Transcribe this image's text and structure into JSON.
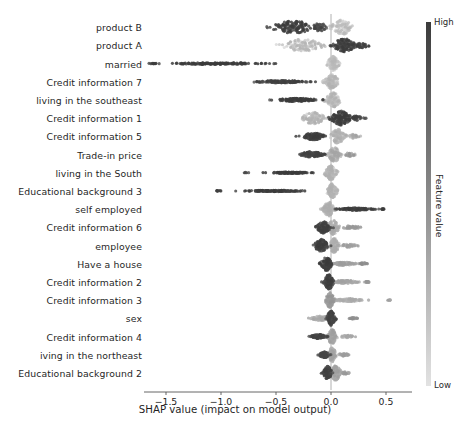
{
  "figure": {
    "width": 470,
    "height": 432,
    "background": "#ffffff"
  },
  "axes": {
    "plot_left": 148,
    "plot_right": 408,
    "plot_top": 18,
    "plot_bottom": 392,
    "zero_x_px": 331,
    "px_per_unit": 110
  },
  "colorbar": {
    "high_label": "High",
    "low_label": "Low",
    "title": "Feature value",
    "high_color": "#3b3b3b",
    "low_color": "#e2e2e2",
    "x": 426,
    "y_top": 22,
    "y_bottom": 386,
    "width": 5
  },
  "caption_ghost": "",
  "chart_data": {
    "type": "scatter",
    "subtype": "shap-beeswarm-summary",
    "title": "",
    "xlabel": "SHAP value (impact on model output)",
    "ylabel": "",
    "colorbar_label": "Feature value",
    "grid": false,
    "legend": "colorbar-right",
    "xlim": [
      -1.75,
      0.62
    ],
    "xticks": [
      -1.5,
      -1.0,
      -0.5,
      0.0,
      0.5
    ],
    "xticklabels": [
      "−1.5",
      "−1.0",
      "−0.5",
      "0.0",
      "0.5"
    ],
    "zero_line": 0.0,
    "color_scale": {
      "low": "#e2e2e2",
      "high": "#3b3b3b",
      "low_label": "Low",
      "high_label": "High"
    },
    "categories": [
      "product B",
      "product A",
      "married",
      "Credit information 7",
      "living in the southeast",
      "Credit information 1",
      "Credit information 5",
      "Trade-in price",
      "living in the South",
      "Educational background 3",
      "self employed",
      "Credit information 6",
      "employee",
      "Have a house",
      "Credit information 2",
      "Credit information 3",
      "sex",
      "Credit information 4",
      "iving in the northeast",
      "Educational background 2"
    ],
    "series": [
      {
        "name": "product B",
        "n": 260,
        "clusters": [
          {
            "center": -0.34,
            "spread": 0.175,
            "weight": 0.48,
            "value": 0.92,
            "thickness": 0.85
          },
          {
            "center": -0.1,
            "spread": 0.075,
            "weight": 0.17,
            "value": 0.8,
            "thickness": 0.55
          },
          {
            "center": 0.1,
            "spread": 0.085,
            "weight": 0.35,
            "value": 0.1,
            "thickness": 1.0
          }
        ],
        "range": [
          -0.62,
          0.3
        ]
      },
      {
        "name": "product A",
        "n": 260,
        "clusters": [
          {
            "center": -0.26,
            "spread": 0.155,
            "weight": 0.42,
            "value": 0.12,
            "thickness": 0.9
          },
          {
            "center": 0.12,
            "spread": 0.085,
            "weight": 0.45,
            "value": 0.92,
            "thickness": 1.0
          },
          {
            "center": 0.27,
            "spread": 0.075,
            "weight": 0.13,
            "value": 0.88,
            "thickness": 0.35
          }
        ],
        "range": [
          -0.52,
          0.4
        ]
      },
      {
        "name": "married",
        "n": 260,
        "clusters": [
          {
            "center": -1.05,
            "spread": 0.4,
            "weight": 0.55,
            "value": 0.95,
            "thickness": 0.12
          },
          {
            "center": -1.6,
            "spread": 0.05,
            "weight": 0.04,
            "value": 0.95,
            "thickness": 0.06
          },
          {
            "center": 0.02,
            "spread": 0.045,
            "weight": 0.41,
            "value": 0.1,
            "thickness": 1.0
          }
        ],
        "range": [
          -1.68,
          0.12
        ]
      },
      {
        "name": "Credit information 7",
        "n": 260,
        "clusters": [
          {
            "center": -0.45,
            "spread": 0.23,
            "weight": 0.52,
            "value": 0.88,
            "thickness": 0.16
          },
          {
            "center": 0.01,
            "spread": 0.055,
            "weight": 0.48,
            "value": 0.13,
            "thickness": 1.0
          }
        ],
        "range": [
          -0.9,
          0.14
        ]
      },
      {
        "name": "living in the southeast",
        "n": 260,
        "clusters": [
          {
            "center": -0.3,
            "spread": 0.175,
            "weight": 0.5,
            "value": 0.9,
            "thickness": 0.22
          },
          {
            "center": 0.02,
            "spread": 0.06,
            "weight": 0.5,
            "value": 0.12,
            "thickness": 1.0
          }
        ],
        "range": [
          -0.6,
          0.16
        ]
      },
      {
        "name": "Credit information 1",
        "n": 260,
        "clusters": [
          {
            "center": -0.16,
            "spread": 0.095,
            "weight": 0.42,
            "value": 0.14,
            "thickness": 0.8
          },
          {
            "center": 0.09,
            "spread": 0.075,
            "weight": 0.47,
            "value": 0.93,
            "thickness": 1.0
          },
          {
            "center": 0.23,
            "spread": 0.055,
            "weight": 0.11,
            "value": 0.88,
            "thickness": 0.3
          }
        ],
        "range": [
          -0.34,
          0.33
        ]
      },
      {
        "name": "Credit information 5",
        "n": 260,
        "clusters": [
          {
            "center": -0.16,
            "spread": 0.085,
            "weight": 0.45,
            "value": 0.9,
            "thickness": 0.5
          },
          {
            "center": 0.06,
            "spread": 0.06,
            "weight": 0.45,
            "value": 0.16,
            "thickness": 1.0
          },
          {
            "center": 0.2,
            "spread": 0.045,
            "weight": 0.1,
            "value": 0.22,
            "thickness": 0.28
          }
        ],
        "range": [
          -0.33,
          0.28
        ]
      },
      {
        "name": "Trade-in price",
        "n": 260,
        "clusters": [
          {
            "center": -0.18,
            "spread": 0.095,
            "weight": 0.48,
            "value": 0.86,
            "thickness": 0.38
          },
          {
            "center": 0.03,
            "spread": 0.05,
            "weight": 0.43,
            "value": 0.2,
            "thickness": 1.0
          },
          {
            "center": 0.17,
            "spread": 0.045,
            "weight": 0.09,
            "value": 0.3,
            "thickness": 0.26
          }
        ],
        "range": [
          -0.34,
          0.25
        ]
      },
      {
        "name": "living in the South",
        "n": 260,
        "clusters": [
          {
            "center": -0.36,
            "spread": 0.17,
            "weight": 0.46,
            "value": 0.9,
            "thickness": 0.1
          },
          {
            "center": -0.78,
            "spread": 0.02,
            "weight": 0.02,
            "value": 0.9,
            "thickness": 0.05
          },
          {
            "center": 0.0,
            "spread": 0.045,
            "weight": 0.52,
            "value": 0.14,
            "thickness": 1.0
          }
        ],
        "range": [
          -0.82,
          0.1
        ]
      },
      {
        "name": "Educational background 3",
        "n": 260,
        "clusters": [
          {
            "center": -0.5,
            "spread": 0.26,
            "weight": 0.5,
            "value": 0.9,
            "thickness": 0.1
          },
          {
            "center": -1.02,
            "spread": 0.03,
            "weight": 0.03,
            "value": 0.9,
            "thickness": 0.05
          },
          {
            "center": 0.01,
            "spread": 0.04,
            "weight": 0.47,
            "value": 0.14,
            "thickness": 1.0
          }
        ],
        "range": [
          -1.08,
          0.08
        ]
      },
      {
        "name": "self employed",
        "n": 260,
        "clusters": [
          {
            "center": -0.02,
            "spread": 0.045,
            "weight": 0.52,
            "value": 0.16,
            "thickness": 1.0
          },
          {
            "center": 0.22,
            "spread": 0.13,
            "weight": 0.44,
            "value": 0.9,
            "thickness": 0.16
          },
          {
            "center": 0.47,
            "spread": 0.03,
            "weight": 0.04,
            "value": 0.9,
            "thickness": 0.06
          }
        ],
        "range": [
          -0.1,
          0.5
        ]
      },
      {
        "name": "Credit information 6",
        "n": 260,
        "clusters": [
          {
            "center": -0.07,
            "spread": 0.055,
            "weight": 0.42,
            "value": 0.88,
            "thickness": 0.8
          },
          {
            "center": 0.02,
            "spread": 0.045,
            "weight": 0.42,
            "value": 0.18,
            "thickness": 1.0
          },
          {
            "center": 0.18,
            "spread": 0.075,
            "weight": 0.16,
            "value": 0.3,
            "thickness": 0.24
          }
        ],
        "range": [
          -0.17,
          0.32
        ]
      },
      {
        "name": "employee",
        "n": 260,
        "clusters": [
          {
            "center": -0.09,
            "spread": 0.055,
            "weight": 0.4,
            "value": 0.9,
            "thickness": 0.85
          },
          {
            "center": 0.03,
            "spread": 0.04,
            "weight": 0.44,
            "value": 0.16,
            "thickness": 1.0
          },
          {
            "center": 0.16,
            "spread": 0.07,
            "weight": 0.16,
            "value": 0.26,
            "thickness": 0.22
          }
        ],
        "range": [
          -0.18,
          0.28
        ]
      },
      {
        "name": "Have a house",
        "n": 260,
        "clusters": [
          {
            "center": -0.04,
            "spread": 0.04,
            "weight": 0.46,
            "value": 0.9,
            "thickness": 1.0
          },
          {
            "center": 0.12,
            "spread": 0.09,
            "weight": 0.42,
            "value": 0.26,
            "thickness": 0.22
          },
          {
            "center": 0.29,
            "spread": 0.03,
            "weight": 0.12,
            "value": 0.35,
            "thickness": 0.12
          }
        ],
        "range": [
          -0.12,
          0.34
        ]
      },
      {
        "name": "Credit information 2",
        "n": 260,
        "clusters": [
          {
            "center": -0.02,
            "spread": 0.035,
            "weight": 0.46,
            "value": 0.88,
            "thickness": 1.0
          },
          {
            "center": 0.13,
            "spread": 0.1,
            "weight": 0.44,
            "value": 0.22,
            "thickness": 0.2
          },
          {
            "center": 0.33,
            "spread": 0.02,
            "weight": 0.1,
            "value": 0.3,
            "thickness": 0.08
          }
        ],
        "range": [
          -0.13,
          0.36
        ]
      },
      {
        "name": "Credit information 3",
        "n": 260,
        "clusters": [
          {
            "center": -0.01,
            "spread": 0.035,
            "weight": 0.44,
            "value": 0.3,
            "thickness": 1.0
          },
          {
            "center": 0.16,
            "spread": 0.12,
            "weight": 0.48,
            "value": 0.18,
            "thickness": 0.18
          },
          {
            "center": 0.53,
            "spread": 0.015,
            "weight": 0.03,
            "value": 0.25,
            "thickness": 0.05
          }
        ],
        "range": [
          -0.1,
          0.56
        ]
      },
      {
        "name": "sex",
        "n": 260,
        "clusters": [
          {
            "center": -0.1,
            "spread": 0.075,
            "weight": 0.42,
            "value": 0.2,
            "thickness": 0.3
          },
          {
            "center": 0.0,
            "spread": 0.035,
            "weight": 0.46,
            "value": 0.86,
            "thickness": 1.0
          },
          {
            "center": 0.2,
            "spread": 0.03,
            "weight": 0.12,
            "value": 0.35,
            "thickness": 0.1
          }
        ],
        "range": [
          -0.22,
          0.24
        ]
      },
      {
        "name": "Credit information 4",
        "n": 260,
        "clusters": [
          {
            "center": -0.11,
            "spread": 0.065,
            "weight": 0.4,
            "value": 0.85,
            "thickness": 0.28
          },
          {
            "center": 0.01,
            "spread": 0.035,
            "weight": 0.46,
            "value": 0.24,
            "thickness": 1.0
          },
          {
            "center": 0.15,
            "spread": 0.055,
            "weight": 0.14,
            "value": 0.2,
            "thickness": 0.18
          }
        ],
        "range": [
          -0.2,
          0.24
        ]
      },
      {
        "name": "iving in the northeast",
        "n": 260,
        "clusters": [
          {
            "center": -0.06,
            "spread": 0.04,
            "weight": 0.4,
            "value": 0.82,
            "thickness": 0.4
          },
          {
            "center": 0.01,
            "spread": 0.03,
            "weight": 0.46,
            "value": 0.22,
            "thickness": 1.0
          },
          {
            "center": 0.11,
            "spread": 0.045,
            "weight": 0.14,
            "value": 0.26,
            "thickness": 0.18
          }
        ],
        "range": [
          -0.12,
          0.18
        ]
      },
      {
        "name": "Educational background 2",
        "n": 260,
        "clusters": [
          {
            "center": -0.03,
            "spread": 0.035,
            "weight": 0.44,
            "value": 0.86,
            "thickness": 0.9
          },
          {
            "center": 0.04,
            "spread": 0.045,
            "weight": 0.44,
            "value": 0.24,
            "thickness": 1.0
          },
          {
            "center": 0.13,
            "spread": 0.035,
            "weight": 0.12,
            "value": 0.3,
            "thickness": 0.16
          }
        ],
        "range": [
          -0.1,
          0.18
        ]
      }
    ]
  }
}
